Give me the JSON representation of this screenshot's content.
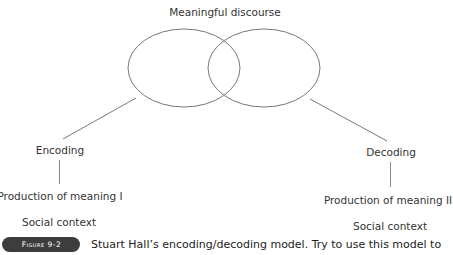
{
  "diagram": {
    "title": "Meaningful discourse",
    "left_branch": {
      "process": "Encoding",
      "production": "Production of meaning I",
      "context": "Social context"
    },
    "right_branch": {
      "process": "Decoding",
      "production": "Production of meaning II",
      "context": "Social context"
    },
    "colors": {
      "stroke": "#7a7a7a",
      "text": "#333333",
      "badge_bg": "#3d3d3d",
      "badge_text": "#ffffff"
    }
  },
  "caption": {
    "figure_label": "Figure 9-2",
    "text": "Stuart Hall’s encoding/decoding model. Try to use this model to"
  }
}
